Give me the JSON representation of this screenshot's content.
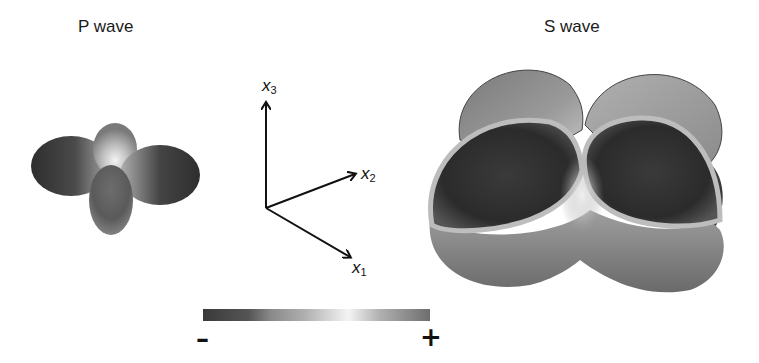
{
  "titles": {
    "p_wave": "P wave",
    "s_wave": "S wave"
  },
  "axes": {
    "x1": {
      "var": "x",
      "sub": "1"
    },
    "x2": {
      "var": "x",
      "sub": "2"
    },
    "x3": {
      "var": "x",
      "sub": "3"
    }
  },
  "colorbar": {
    "min_label": "–",
    "max_label": "+",
    "colors": [
      "#3a3a3a",
      "#7a7a7a",
      "#a8a8a8",
      "#bdbdbd",
      "#f2f2f2",
      "#a8a8a8",
      "#707070"
    ]
  },
  "colors": {
    "dark": "#3b3b3b",
    "mid": "#8a8a8a",
    "light": "#e8e8e8",
    "arrow": "#111111"
  }
}
